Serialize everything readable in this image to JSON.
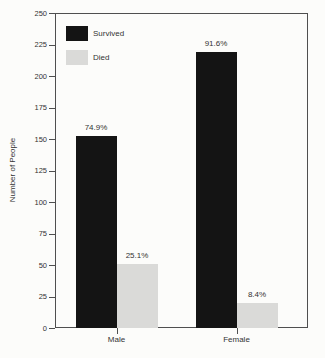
{
  "figure": {
    "background": "#fcfcfa"
  },
  "chart_data": {
    "type": "bar",
    "title": "",
    "categories": [
      "Male",
      "Female"
    ],
    "series": [
      {
        "name": "Survived",
        "color": "#141414",
        "values": [
          152,
          219
        ],
        "percent_labels": [
          "74.9%",
          "91.6%"
        ]
      },
      {
        "name": "Died",
        "color": "#dadad8",
        "values": [
          51,
          20
        ],
        "percent_labels": [
          "25.1%",
          "8.4%"
        ]
      }
    ],
    "xlabel": "",
    "ylabel": "Number of People",
    "ylim": [
      0,
      250
    ],
    "yticks": [
      0,
      25,
      50,
      75,
      100,
      125,
      150,
      175,
      200,
      225,
      250
    ],
    "grid": false,
    "legend_position": "top-left-inside",
    "axis_color": "#4f4f4f",
    "text_color": "#333333"
  }
}
